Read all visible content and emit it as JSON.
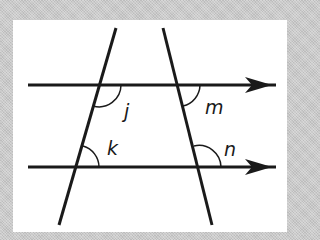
{
  "diagram": {
    "type": "parallel-lines-with-transversals",
    "colors": {
      "line": "#1a1a1a",
      "arc": "#1a1a1a",
      "panel": "#ffffff",
      "border": "#c9c9c9"
    },
    "parallel_lines": [
      {
        "id": "upper",
        "has_arrow": true
      },
      {
        "id": "lower",
        "has_arrow": true
      }
    ],
    "transversals": [
      {
        "id": "left"
      },
      {
        "id": "right"
      }
    ],
    "angles": [
      {
        "label": "j",
        "at": "left transversal × upper line",
        "position": "below-right"
      },
      {
        "label": "m",
        "at": "right transversal × upper line",
        "position": "below-right"
      },
      {
        "label": "k",
        "at": "left transversal × lower line",
        "position": "above-right"
      },
      {
        "label": "n",
        "at": "right transversal × lower line",
        "position": "above-right"
      }
    ]
  }
}
